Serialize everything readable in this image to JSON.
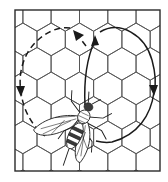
{
  "diagram": {
    "title": "Honeybee waggle dance on honeycomb",
    "subject": "bee",
    "background": "honeycomb",
    "colors": {
      "background": "#ffffff",
      "grid": "#555555",
      "ink": "#1a1a1a"
    },
    "frame": {
      "x": 15,
      "y": 10,
      "width": 145,
      "height": 161
    },
    "honeycomb": {
      "orientation": "pointy-top",
      "cell_width": 28.3,
      "row_pitch": 24.5,
      "rows": 8,
      "cols": 6
    },
    "paths": [
      {
        "name": "waggle-run",
        "style": "solid",
        "direction": "up",
        "from": [
          85,
          105
        ],
        "to": [
          95,
          38
        ]
      },
      {
        "name": "right-return-loop",
        "style": "solid",
        "direction": "clockwise",
        "arrow_at": [
          154,
          90
        ],
        "arrow_direction": "down"
      },
      {
        "name": "left-return-loop",
        "style": "dashed",
        "direction": "counterclockwise",
        "arrow_at": [
          21,
          93
        ],
        "arrow_direction": "down"
      }
    ],
    "arrows": [
      {
        "name": "waggle-arrow",
        "at": [
          95,
          38
        ],
        "direction": "up"
      },
      {
        "name": "left-loop-top-arrow",
        "at": [
          75,
          32
        ],
        "direction": "up-left"
      },
      {
        "name": "right-loop-arrow",
        "at": [
          154,
          90
        ],
        "direction": "down"
      },
      {
        "name": "left-loop-arrow",
        "at": [
          21,
          93
        ],
        "direction": "down"
      }
    ]
  }
}
